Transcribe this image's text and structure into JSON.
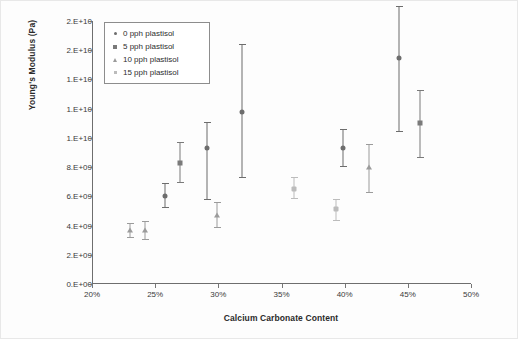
{
  "chart": {
    "title": "",
    "xlabel": "Calcium Carbonate Content",
    "ylabel": "Young's Modulus (Pa)",
    "ytick_labels": [
      "2.E+10",
      "2.E+10",
      "1.E+10",
      "1.E+10",
      "1.E+10",
      "8.E+09",
      "6.E+09",
      "4.E+09",
      "2.E+09",
      "0.E+00"
    ],
    "xtick_labels": [
      "20%",
      "25%",
      "30%",
      "35%",
      "40%",
      "45%",
      "50%"
    ],
    "legend": {
      "position": "top-left-inside",
      "items": [
        {
          "label": "0 pph plastisol",
          "marker": "dot",
          "color": "#6d6d6d"
        },
        {
          "label": "5 pph plastisol",
          "marker": "square",
          "color": "#7a7a7a"
        },
        {
          "label": "10 pph plastisol",
          "marker": "triangle",
          "color": "#9b9b9b"
        },
        {
          "label": "15 pph plastisol",
          "marker": "x",
          "color": "#bcbcbc"
        }
      ]
    }
  },
  "chart_data": {
    "type": "scatter",
    "title": "",
    "xlabel": "Calcium Carbonate Content",
    "ylabel": "Young's Modulus (Pa)",
    "xlim": [
      20,
      50
    ],
    "ylim": [
      0,
      18000000000
    ],
    "xtick_values": [
      20,
      25,
      30,
      35,
      40,
      45,
      50
    ],
    "ytick_values": [
      18000000000,
      16000000000,
      14000000000,
      12000000000,
      10000000000,
      8000000000,
      6000000000,
      4000000000,
      2000000000,
      0
    ],
    "xtick_labels": [
      "20%",
      "25%",
      "30%",
      "35%",
      "40%",
      "45%",
      "50%"
    ],
    "ytick_labels": [
      "2.E+10",
      "2.E+10",
      "1.E+10",
      "1.E+10",
      "1.E+10",
      "8.E+09",
      "6.E+09",
      "4.E+09",
      "2.E+09",
      "0.E+00"
    ],
    "grid": false,
    "error_bars": "vertical",
    "units": {
      "x": "percent calcium carbonate",
      "y": "Pa"
    },
    "series": [
      {
        "name": "0 pph plastisol",
        "marker": "dot",
        "color": "#6d6d6d",
        "points": [
          {
            "x": 25.8,
            "y": 6000000000,
            "yerr_low": 5300000000,
            "yerr_high": 6900000000
          },
          {
            "x": 29.1,
            "y": 9300000000,
            "yerr_low": 5800000000,
            "yerr_high": 11100000000
          },
          {
            "x": 31.9,
            "y": 11800000000,
            "yerr_low": 7300000000,
            "yerr_high": 16400000000
          },
          {
            "x": 39.9,
            "y": 9300000000,
            "yerr_low": 8100000000,
            "yerr_high": 10600000000
          },
          {
            "x": 44.3,
            "y": 15500000000,
            "yerr_low": 10500000000,
            "yerr_high": 19000000000
          }
        ]
      },
      {
        "name": "5 pph plastisol",
        "marker": "square",
        "color": "#7a7a7a",
        "points": [
          {
            "x": 27.0,
            "y": 8300000000,
            "yerr_low": 7000000000,
            "yerr_high": 9700000000
          },
          {
            "x": 46.0,
            "y": 11000000000,
            "yerr_low": 8700000000,
            "yerr_high": 13300000000
          }
        ]
      },
      {
        "name": "10 pph plastisol",
        "marker": "triangle",
        "color": "#9b9b9b",
        "points": [
          {
            "x": 23.0,
            "y": 3700000000,
            "yerr_low": 3200000000,
            "yerr_high": 4200000000
          },
          {
            "x": 24.2,
            "y": 3700000000,
            "yerr_low": 3100000000,
            "yerr_high": 4300000000
          },
          {
            "x": 29.9,
            "y": 4700000000,
            "yerr_low": 3900000000,
            "yerr_high": 5600000000
          },
          {
            "x": 41.9,
            "y": 8000000000,
            "yerr_low": 6300000000,
            "yerr_high": 9600000000
          }
        ]
      },
      {
        "name": "15 pph plastisol",
        "marker": "x",
        "color": "#bcbcbc",
        "points": [
          {
            "x": 36.0,
            "y": 6500000000,
            "yerr_low": 5900000000,
            "yerr_high": 7300000000
          },
          {
            "x": 39.3,
            "y": 5100000000,
            "yerr_low": 4400000000,
            "yerr_high": 5800000000
          }
        ]
      }
    ]
  }
}
